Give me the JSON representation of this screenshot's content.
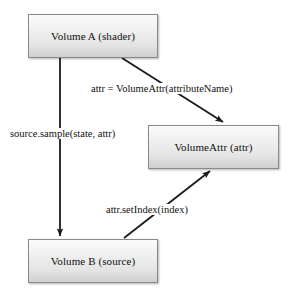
{
  "diagram": {
    "type": "flow-diagram",
    "colors": {
      "node_border": "#8a8a8a",
      "node_fill_top": "#fbfbfb",
      "node_fill_bottom": "#cfcfcf",
      "edge": "#1a1a1a",
      "text": "#111111",
      "background": "#ffffff"
    },
    "nodes": [
      {
        "id": "volume-a",
        "label": "Volume A (shader)"
      },
      {
        "id": "volume-attr",
        "label": "VolumeAttr (attr)"
      },
      {
        "id": "volume-b",
        "label": "Volume B (source)"
      }
    ],
    "edges": [
      {
        "id": "a-to-volumeattr",
        "from": "volume-a",
        "to": "volume-attr",
        "label": "attr = VolumeAttr(attributeName)"
      },
      {
        "id": "a-to-b",
        "from": "volume-a",
        "to": "volume-b",
        "label": "source.sample(state, attr)"
      },
      {
        "id": "b-to-volumeattr",
        "from": "volume-b",
        "to": "volume-attr",
        "label": "attr.setIndex(index)"
      }
    ]
  }
}
